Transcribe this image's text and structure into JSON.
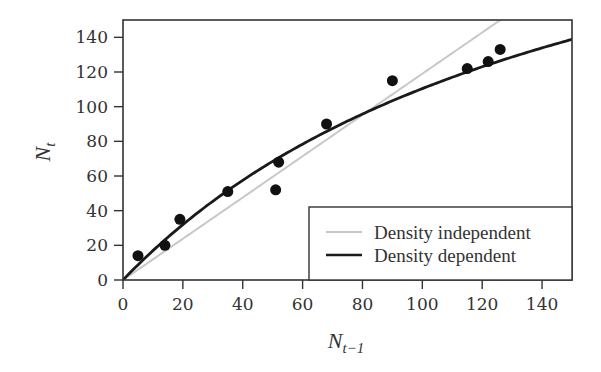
{
  "chart_data": {
    "type": "scatter",
    "title": "",
    "xlabel": "N_{t-1}",
    "ylabel": "N_t",
    "xlim": [
      0,
      150
    ],
    "ylim": [
      0,
      150
    ],
    "xticks": [
      0,
      20,
      40,
      60,
      80,
      100,
      120,
      140
    ],
    "yticks": [
      0,
      20,
      40,
      60,
      80,
      100,
      120,
      140
    ],
    "grid": false,
    "legend_position": "lower right",
    "points": {
      "name": "Observed",
      "x": [
        5,
        14,
        19,
        35,
        51,
        52,
        68,
        90,
        115,
        122,
        126
      ],
      "y": [
        14,
        20,
        35,
        51,
        52,
        68,
        90,
        115,
        122,
        126,
        133
      ]
    },
    "series": [
      {
        "name": "Density independent",
        "kind": "line",
        "model": "N_t = R * N_{t-1}",
        "params": {
          "R": 1.19
        },
        "color": "#c8c8c8"
      },
      {
        "name": "Density dependent",
        "kind": "curve",
        "model": "N_t = R * N_{t-1} / (1 + a * N_{t-1})",
        "params": {
          "R": 1.8,
          "a": 0.0063
        },
        "color": "#1a1a1a"
      }
    ]
  },
  "labels": {
    "x_main": "N",
    "x_sub": "t−1",
    "y_main": "N",
    "y_sub": "t"
  },
  "legend": {
    "items": [
      {
        "label": "Density independent",
        "color": "#c8c8c8"
      },
      {
        "label": "Density dependent",
        "color": "#1a1a1a"
      }
    ]
  }
}
